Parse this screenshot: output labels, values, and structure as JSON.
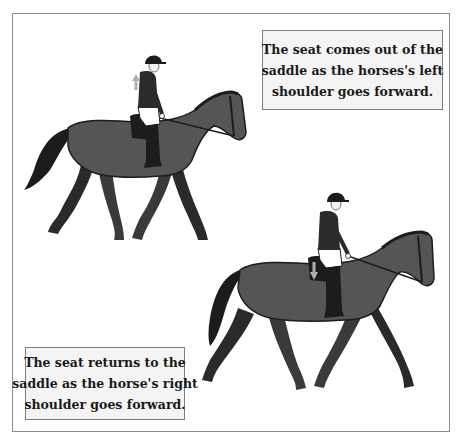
{
  "figure": {
    "captions": {
      "top": {
        "lines": [
          "The seat comes out of the",
          "saddle as the horses's left",
          "shoulder goes forward."
        ]
      },
      "bottom": {
        "lines": [
          "The seat returns to the",
          "saddle as the horse's right",
          "shoulder goes forward."
        ]
      }
    },
    "illustrations": [
      {
        "name": "horse-rider-rising",
        "arrow": "up-arrow-icon"
      },
      {
        "name": "horse-rider-sitting",
        "arrow": "down-arrow-icon"
      }
    ],
    "colors": {
      "horse_body": "#555555",
      "horse_dark": "#1c1c1c",
      "jacket": "#2b2b2b",
      "breeches": "#ffffff",
      "arrow": "#b0b0b0",
      "frame_border": "#8a8a8a",
      "caption_bg": "#f4f4f4"
    }
  }
}
